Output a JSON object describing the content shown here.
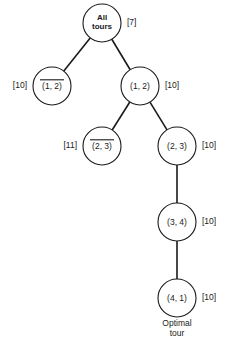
{
  "chart_data": {
    "type": "diagram",
    "diagram_kind": "branch-and-bound-tree",
    "title": "",
    "nodes": [
      {
        "id": "root",
        "label_lines": [
          "All",
          "tours"
        ],
        "overlined": false,
        "bound": "[7]",
        "bound_side": "right",
        "cx": 102,
        "cy": 23,
        "r": 19
      },
      {
        "id": "n-not12",
        "label_lines": [
          "(1, 2)"
        ],
        "overlined": true,
        "bound": "[10]",
        "bound_side": "left",
        "cx": 52,
        "cy": 86,
        "r": 19
      },
      {
        "id": "n-12",
        "label_lines": [
          "(1, 2)"
        ],
        "overlined": false,
        "bound": "[10]",
        "bound_side": "right",
        "cx": 140,
        "cy": 86,
        "r": 19
      },
      {
        "id": "n-not23",
        "label_lines": [
          "(2, 3)"
        ],
        "overlined": true,
        "bound": "[11]",
        "bound_side": "left",
        "cx": 102,
        "cy": 146,
        "r": 19
      },
      {
        "id": "n-23",
        "label_lines": [
          "(2, 3)"
        ],
        "overlined": false,
        "bound": "[10]",
        "bound_side": "right",
        "cx": 177,
        "cy": 146,
        "r": 19
      },
      {
        "id": "n-34",
        "label_lines": [
          "(3, 4)"
        ],
        "overlined": false,
        "bound": "[10]",
        "bound_side": "right",
        "cx": 177,
        "cy": 222,
        "r": 19
      },
      {
        "id": "n-41",
        "label_lines": [
          "(4, 1)"
        ],
        "overlined": false,
        "bound": "[10]",
        "bound_side": "right",
        "cx": 177,
        "cy": 298,
        "r": 19
      }
    ],
    "edges": [
      {
        "from": "root",
        "to": "n-not12"
      },
      {
        "from": "root",
        "to": "n-12"
      },
      {
        "from": "n-12",
        "to": "n-not23"
      },
      {
        "from": "n-12",
        "to": "n-23"
      },
      {
        "from": "n-23",
        "to": "n-34"
      },
      {
        "from": "n-34",
        "to": "n-41"
      }
    ],
    "captions": [
      {
        "id": "optimal-tour-caption",
        "lines": [
          "Optimal",
          "tour"
        ],
        "x": 177,
        "y": 326
      }
    ],
    "colors": {
      "stroke": "#1a1a1a",
      "node_fill": "#ffffff",
      "background": "#ffffff",
      "text": "#1a1a1a"
    }
  }
}
